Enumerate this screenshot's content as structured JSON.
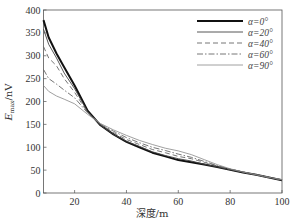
{
  "chart_data": {
    "type": "line",
    "title": "",
    "xlabel": "深度/m",
    "ylabel": "E_max/nV",
    "ylabel_main": "E",
    "ylabel_sub": "max",
    "ylabel_unit": "/nV",
    "xlim": [
      8,
      100
    ],
    "ylim": [
      0,
      400
    ],
    "xticks": [
      20,
      40,
      60,
      80,
      100
    ],
    "yticks": [
      0,
      50,
      100,
      150,
      200,
      250,
      300,
      350,
      400
    ],
    "grid": false,
    "legend_position": "upper right",
    "x": [
      8,
      10,
      13,
      16,
      20,
      25,
      30,
      35,
      40,
      45,
      50,
      55,
      60,
      65,
      70,
      75,
      80,
      85,
      90,
      95,
      100
    ],
    "series": [
      {
        "name": "α=0°",
        "style": "solid-thick",
        "values": [
          378,
          340,
          305,
          275,
          235,
          180,
          148,
          128,
          112,
          100,
          88,
          80,
          72,
          67,
          62,
          57,
          51,
          45,
          40,
          34,
          28
        ]
      },
      {
        "name": "α=20°",
        "style": "solid",
        "values": [
          358,
          325,
          295,
          262,
          228,
          178,
          148,
          128,
          113,
          102,
          90,
          82,
          75,
          70,
          63,
          57,
          51,
          45,
          40,
          34,
          28
        ]
      },
      {
        "name": "α=40°",
        "style": "dashed",
        "values": [
          320,
          295,
          278,
          250,
          220,
          176,
          150,
          132,
          117,
          106,
          95,
          88,
          80,
          75,
          67,
          59,
          52,
          46,
          40,
          34,
          29
        ]
      },
      {
        "name": "α=60°",
        "style": "dash-dot",
        "values": [
          270,
          250,
          238,
          225,
          208,
          175,
          150,
          135,
          121,
          110,
          100,
          93,
          85,
          78,
          69,
          60,
          52,
          46,
          40,
          34,
          29
        ]
      },
      {
        "name": "α=90°",
        "style": "solid-thin",
        "values": [
          235,
          222,
          212,
          205,
          195,
          172,
          152,
          138,
          126,
          115,
          106,
          98,
          92,
          84,
          73,
          62,
          53,
          46,
          40,
          34,
          29
        ]
      }
    ]
  }
}
